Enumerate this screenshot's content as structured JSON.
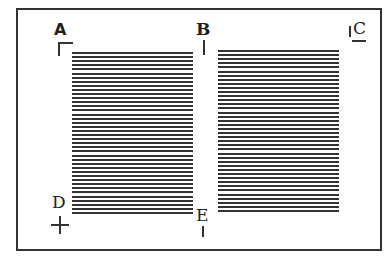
{
  "diagram": {
    "labels": {
      "a": "A",
      "b": "B",
      "c": "C",
      "d": "D",
      "e": "E"
    },
    "marks": {
      "a": "corner-bracket",
      "b": "vertical-tick",
      "c": "vertical-tick-with-underline",
      "d": "crosshair",
      "e": "vertical-tick"
    },
    "columns": [
      {
        "name": "left-column",
        "line_count": 40
      },
      {
        "name": "right-column",
        "line_count": 40
      }
    ],
    "colors": {
      "ink": "#333333",
      "background": "#ffffff"
    }
  }
}
